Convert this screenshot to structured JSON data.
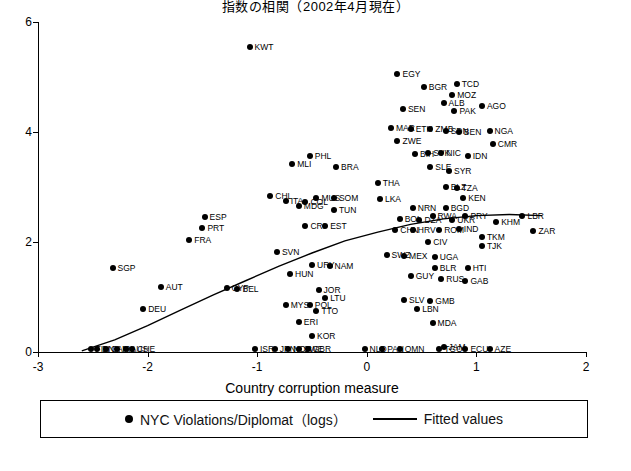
{
  "chart_data": {
    "type": "scatter",
    "title": "指数の相関（2002年4月現在）",
    "xlabel": "Country corruption measure",
    "ylabel": "",
    "xlim": [
      -3,
      2
    ],
    "ylim": [
      0,
      6
    ],
    "xticks": [
      "-3",
      "-2",
      "-1",
      "0",
      "1",
      "2"
    ],
    "yticks": [
      "0",
      "2",
      "4",
      "6"
    ],
    "grid": false,
    "legend_position": "bottom",
    "series": [
      {
        "name": "NYC Violations/Diplomat（logs）",
        "marker": "filled-circle",
        "points": [
          {
            "label": "KWT",
            "x": -1.07,
            "y": 5.55
          },
          {
            "label": "EGY",
            "x": 0.28,
            "y": 5.05
          },
          {
            "label": "BGR",
            "x": 0.52,
            "y": 4.82
          },
          {
            "label": "TCD",
            "x": 0.82,
            "y": 4.88
          },
          {
            "label": "MOZ",
            "x": 0.78,
            "y": 4.68
          },
          {
            "label": "ALB",
            "x": 0.7,
            "y": 4.52
          },
          {
            "label": "SEN",
            "x": 0.33,
            "y": 4.42
          },
          {
            "label": "PAK",
            "x": 0.8,
            "y": 4.38
          },
          {
            "label": "AGO",
            "x": 1.05,
            "y": 4.48
          },
          {
            "label": "MAR",
            "x": 0.22,
            "y": 4.08
          },
          {
            "label": "ETH",
            "x": 0.4,
            "y": 4.06
          },
          {
            "label": "ZMB",
            "x": 0.58,
            "y": 4.06
          },
          {
            "label": "SDN",
            "x": 0.72,
            "y": 4.02
          },
          {
            "label": "BEN",
            "x": 0.84,
            "y": 4.0
          },
          {
            "label": "NGA",
            "x": 1.12,
            "y": 4.02
          },
          {
            "label": "ZWE",
            "x": 0.28,
            "y": 3.84
          },
          {
            "label": "CMR",
            "x": 1.15,
            "y": 3.78
          },
          {
            "label": "BIH",
            "x": 0.44,
            "y": 3.6
          },
          {
            "label": "SVK",
            "x": 0.56,
            "y": 3.62
          },
          {
            "label": "NIC",
            "x": 0.68,
            "y": 3.62
          },
          {
            "label": "IDN",
            "x": 0.92,
            "y": 3.56
          },
          {
            "label": "PHL",
            "x": -0.52,
            "y": 3.56
          },
          {
            "label": "MLI",
            "x": -0.68,
            "y": 3.42
          },
          {
            "label": "BRA",
            "x": -0.28,
            "y": 3.36
          },
          {
            "label": "SLE",
            "x": 0.58,
            "y": 3.36
          },
          {
            "label": "SYR",
            "x": 0.75,
            "y": 3.3
          },
          {
            "label": "THA",
            "x": 0.1,
            "y": 3.08
          },
          {
            "label": "BLZ",
            "x": 0.72,
            "y": 3.0
          },
          {
            "label": "TZA",
            "x": 0.82,
            "y": 2.98
          },
          {
            "label": "CHL",
            "x": -0.88,
            "y": 2.84
          },
          {
            "label": "MUS",
            "x": -0.46,
            "y": 2.8
          },
          {
            "label": "SOM",
            "x": -0.3,
            "y": 2.8
          },
          {
            "label": "LKA",
            "x": 0.12,
            "y": 2.78
          },
          {
            "label": "KEN",
            "x": 0.88,
            "y": 2.8
          },
          {
            "label": "COL",
            "x": -0.56,
            "y": 2.72
          },
          {
            "label": "MDG",
            "x": -0.62,
            "y": 2.66
          },
          {
            "label": "NRN",
            "x": 0.42,
            "y": 2.62
          },
          {
            "label": "BGD",
            "x": 0.72,
            "y": 2.62
          },
          {
            "label": "ITA",
            "x": -0.74,
            "y": 2.74
          },
          {
            "label": "TUN",
            "x": -0.3,
            "y": 2.58
          },
          {
            "label": "RWA",
            "x": 0.6,
            "y": 2.48
          },
          {
            "label": "PRY",
            "x": 0.9,
            "y": 2.48
          },
          {
            "label": "LBR",
            "x": 1.42,
            "y": 2.48
          },
          {
            "label": "ESP",
            "x": -1.48,
            "y": 2.46
          },
          {
            "label": "BOL",
            "x": 0.3,
            "y": 2.42
          },
          {
            "label": "DZA",
            "x": 0.48,
            "y": 2.4
          },
          {
            "label": "UKR",
            "x": 0.78,
            "y": 2.4
          },
          {
            "label": "KHM",
            "x": 1.18,
            "y": 2.36
          },
          {
            "label": "CRI",
            "x": -0.56,
            "y": 2.3
          },
          {
            "label": "EST",
            "x": -0.38,
            "y": 2.3
          },
          {
            "label": "PRT",
            "x": -1.5,
            "y": 2.26
          },
          {
            "label": "CHN",
            "x": 0.26,
            "y": 2.22
          },
          {
            "label": "HRV",
            "x": 0.42,
            "y": 2.22
          },
          {
            "label": "ROM",
            "x": 0.66,
            "y": 2.22
          },
          {
            "label": "IND",
            "x": 0.84,
            "y": 2.24
          },
          {
            "label": "ZAR",
            "x": 1.52,
            "y": 2.2
          },
          {
            "label": "TKM",
            "x": 1.05,
            "y": 2.1
          },
          {
            "label": "FRA",
            "x": -1.62,
            "y": 2.04
          },
          {
            "label": "CIV",
            "x": 0.56,
            "y": 2.0
          },
          {
            "label": "TJK",
            "x": 1.05,
            "y": 1.92
          },
          {
            "label": "SVN",
            "x": -0.82,
            "y": 1.82
          },
          {
            "label": "SWZ",
            "x": 0.18,
            "y": 1.76
          },
          {
            "label": "MEX",
            "x": 0.34,
            "y": 1.74
          },
          {
            "label": "UGA",
            "x": 0.62,
            "y": 1.72
          },
          {
            "label": "SGP",
            "x": -2.32,
            "y": 1.52
          },
          {
            "label": "URY",
            "x": -0.5,
            "y": 1.58
          },
          {
            "label": "NAM",
            "x": -0.34,
            "y": 1.56
          },
          {
            "label": "BLR",
            "x": 0.62,
            "y": 1.52
          },
          {
            "label": "HTI",
            "x": 0.92,
            "y": 1.52
          },
          {
            "label": "HUN",
            "x": -0.7,
            "y": 1.42
          },
          {
            "label": "GUY",
            "x": 0.4,
            "y": 1.38
          },
          {
            "label": "RUS",
            "x": 0.68,
            "y": 1.32
          },
          {
            "label": "GAB",
            "x": 0.9,
            "y": 1.3
          },
          {
            "label": "AUT",
            "x": -1.88,
            "y": 1.18
          },
          {
            "label": "CYP",
            "x": -1.28,
            "y": 1.16
          },
          {
            "label": "BEL",
            "x": -1.18,
            "y": 1.14
          },
          {
            "label": "JOR",
            "x": -0.44,
            "y": 1.12
          },
          {
            "label": "LTU",
            "x": -0.38,
            "y": 0.98
          },
          {
            "label": "SLV",
            "x": 0.34,
            "y": 0.94
          },
          {
            "label": "GMB",
            "x": 0.58,
            "y": 0.92
          },
          {
            "label": "MYS",
            "x": -0.74,
            "y": 0.86
          },
          {
            "label": "POL",
            "x": -0.52,
            "y": 0.86
          },
          {
            "label": "DEU",
            "x": -2.04,
            "y": 0.78
          },
          {
            "label": "TTO",
            "x": -0.46,
            "y": 0.74
          },
          {
            "label": "LBN",
            "x": 0.46,
            "y": 0.78
          },
          {
            "label": "ERI",
            "x": -0.62,
            "y": 0.54
          },
          {
            "label": "MDA",
            "x": 0.6,
            "y": 0.52
          },
          {
            "label": "KOR",
            "x": -0.5,
            "y": 0.3
          },
          {
            "label": "ISR",
            "x": -1.02,
            "y": 0.06
          },
          {
            "label": "JPN",
            "x": -0.84,
            "y": 0.06
          },
          {
            "label": "NOR",
            "x": -0.72,
            "y": 0.06
          },
          {
            "label": "SWE",
            "x": -0.62,
            "y": 0.06
          },
          {
            "label": "GBR",
            "x": -0.54,
            "y": 0.06
          },
          {
            "label": "JAM",
            "x": 0.7,
            "y": 0.1
          },
          {
            "label": "TGO",
            "x": 0.66,
            "y": 0.06
          },
          {
            "label": "ECU",
            "x": 0.9,
            "y": 0.06
          },
          {
            "label": "AZE",
            "x": 1.12,
            "y": 0.06
          },
          {
            "label": "NLD",
            "x": -0.02,
            "y": 0.06
          },
          {
            "label": "PAN",
            "x": 0.14,
            "y": 0.06
          },
          {
            "label": "OMN",
            "x": 0.3,
            "y": 0.06
          },
          {
            "label": "FIN",
            "x": -2.52,
            "y": 0.06
          },
          {
            "label": "DNK",
            "x": -2.46,
            "y": 0.06
          },
          {
            "label": "CAN",
            "x": -2.38,
            "y": 0.06
          },
          {
            "label": "IRL",
            "x": -2.28,
            "y": 0.06
          },
          {
            "label": "AUS",
            "x": -2.2,
            "y": 0.06
          },
          {
            "label": "CHE",
            "x": -2.14,
            "y": 0.06
          }
        ]
      },
      {
        "name": "Fitted values",
        "marker": "line",
        "curve": [
          {
            "x": -2.6,
            "y": 0.02
          },
          {
            "x": -2.3,
            "y": 0.22
          },
          {
            "x": -2.0,
            "y": 0.48
          },
          {
            "x": -1.7,
            "y": 0.76
          },
          {
            "x": -1.4,
            "y": 1.04
          },
          {
            "x": -1.1,
            "y": 1.3
          },
          {
            "x": -0.8,
            "y": 1.56
          },
          {
            "x": -0.5,
            "y": 1.8
          },
          {
            "x": -0.2,
            "y": 2.02
          },
          {
            "x": 0.1,
            "y": 2.18
          },
          {
            "x": 0.4,
            "y": 2.32
          },
          {
            "x": 0.7,
            "y": 2.42
          },
          {
            "x": 1.0,
            "y": 2.48
          },
          {
            "x": 1.3,
            "y": 2.5
          },
          {
            "x": 1.6,
            "y": 2.48
          }
        ]
      }
    ],
    "legend": [
      {
        "label": "NYC Violations/Diplomat（logs）",
        "marker": "dot"
      },
      {
        "label": "Fitted values",
        "marker": "line"
      }
    ]
  }
}
